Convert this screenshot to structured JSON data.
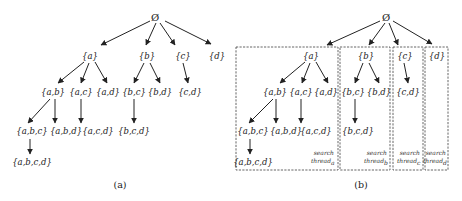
{
  "panel_a": {
    "caption": "(a)",
    "nodes": {
      "root": "Ø",
      "a": "{a}",
      "b": "{b}",
      "c": "{c}",
      "d": "{d}",
      "ab": "{a,b}",
      "ac": "{a,c}",
      "ad": "{a,d}",
      "bc": "{b,c}",
      "bd": "{b,d}",
      "cd": "{c,d}",
      "abc": "{a,b,c}",
      "abd": "{a,b,d}",
      "acd": "{a,c,d}",
      "bcd": "{b,c,d}",
      "abcd": "{a,b,c,d}"
    }
  },
  "panel_b": {
    "caption": "(b)",
    "nodes": {
      "root": "Ø",
      "a": "{a}",
      "b": "{b}",
      "c": "{c}",
      "d": "{d}",
      "ab": "{a,b}",
      "ac": "{a,c}",
      "ad": "{a,d}",
      "bc": "{b,c}",
      "bd": "{b,d}",
      "cd": "{c,d}",
      "abc": "{a,b,c}",
      "abd": "{a,b,d}",
      "acd": "{a,c,d}",
      "bcd": "{b,c,d}",
      "abcd": "{a,b,c,d}"
    },
    "threads": [
      {
        "line1": "search",
        "line2": "thread",
        "sub": "a"
      },
      {
        "line1": "search",
        "line2": "thread",
        "sub": "b"
      },
      {
        "line1": "search",
        "line2": "thread",
        "sub": "c"
      },
      {
        "line1": "search",
        "line2": "thread",
        "sub": "d"
      }
    ]
  },
  "edges": [
    [
      "root",
      "a"
    ],
    [
      "root",
      "b"
    ],
    [
      "root",
      "c"
    ],
    [
      "root",
      "d"
    ],
    [
      "a",
      "ab"
    ],
    [
      "a",
      "ac"
    ],
    [
      "a",
      "ad"
    ],
    [
      "b",
      "bc"
    ],
    [
      "b",
      "bd"
    ],
    [
      "c",
      "cd"
    ],
    [
      "ab",
      "abc"
    ],
    [
      "ab",
      "abd"
    ],
    [
      "ac",
      "acd"
    ],
    [
      "bc",
      "bcd"
    ],
    [
      "abc",
      "abcd"
    ]
  ]
}
